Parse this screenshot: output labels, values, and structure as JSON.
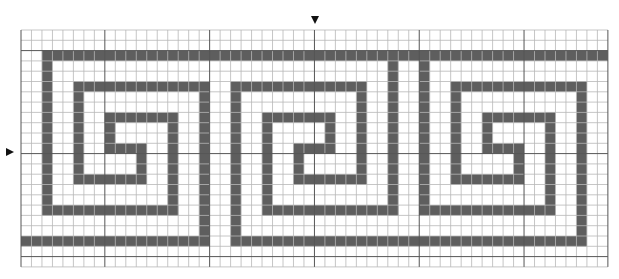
{
  "diagram": {
    "grid": {
      "origin_x": 21,
      "origin_y": 30,
      "cols": 56,
      "rows": 23,
      "cell_w": 10.48,
      "cell_h": 10.3,
      "major_every": 10,
      "major_col_offset": 8,
      "major_row_offset": 2,
      "line_color": "#b8b8b8",
      "major_line_color": "#555555",
      "fill_color": "#5e5e5e",
      "background": "#ffffff"
    },
    "markers": [
      {
        "name": "center-column-marker",
        "direction": "down",
        "col": 28
      },
      {
        "name": "center-row-marker",
        "direction": "right",
        "row": 12
      }
    ],
    "segments": [
      {
        "motif": "top-border",
        "type": "h",
        "row": 2,
        "from": 2,
        "to": 55
      },
      {
        "motif": "motif-1",
        "type": "v",
        "col": 2,
        "from": 2,
        "to": 17
      },
      {
        "motif": "motif-1",
        "type": "h",
        "row": 17,
        "from": 2,
        "to": 14
      },
      {
        "motif": "motif-1",
        "type": "v",
        "col": 14,
        "from": 8,
        "to": 17
      },
      {
        "motif": "motif-1",
        "type": "h",
        "row": 8,
        "from": 8,
        "to": 14
      },
      {
        "motif": "motif-1",
        "type": "v",
        "col": 8,
        "from": 8,
        "to": 11
      },
      {
        "motif": "motif-1",
        "type": "h",
        "row": 11,
        "from": 8,
        "to": 11
      },
      {
        "motif": "motif-1",
        "type": "v",
        "col": 11,
        "from": 11,
        "to": 14
      },
      {
        "motif": "motif-1",
        "type": "h",
        "row": 14,
        "from": 5,
        "to": 11
      },
      {
        "motif": "motif-1",
        "type": "v",
        "col": 5,
        "from": 5,
        "to": 14
      },
      {
        "motif": "motif-1",
        "type": "h",
        "row": 5,
        "from": 5,
        "to": 17
      },
      {
        "motif": "motif-1",
        "type": "v",
        "col": 17,
        "from": 5,
        "to": 20
      },
      {
        "motif": "bottom-border",
        "type": "h",
        "row": 20,
        "from": 0,
        "to": 17
      },
      {
        "motif": "motif-2",
        "type": "v",
        "col": 20,
        "from": 5,
        "to": 20
      },
      {
        "motif": "motif-2",
        "type": "h",
        "row": 5,
        "from": 20,
        "to": 32
      },
      {
        "motif": "motif-2",
        "type": "v",
        "col": 32,
        "from": 5,
        "to": 14
      },
      {
        "motif": "motif-2",
        "type": "h",
        "row": 14,
        "from": 26,
        "to": 32
      },
      {
        "motif": "motif-2",
        "type": "v",
        "col": 26,
        "from": 11,
        "to": 14
      },
      {
        "motif": "motif-2",
        "type": "h",
        "row": 11,
        "from": 26,
        "to": 29
      },
      {
        "motif": "motif-2",
        "type": "v",
        "col": 29,
        "from": 8,
        "to": 11
      },
      {
        "motif": "motif-2",
        "type": "h",
        "row": 8,
        "from": 23,
        "to": 29
      },
      {
        "motif": "motif-2",
        "type": "v",
        "col": 23,
        "from": 8,
        "to": 17
      },
      {
        "motif": "motif-2",
        "type": "h",
        "row": 17,
        "from": 23,
        "to": 35
      },
      {
        "motif": "motif-2",
        "type": "v",
        "col": 35,
        "from": 2,
        "to": 17
      },
      {
        "motif": "bottom-border",
        "type": "h",
        "row": 20,
        "from": 20,
        "to": 53
      },
      {
        "motif": "motif-3",
        "type": "v",
        "col": 38,
        "from": 2,
        "to": 17
      },
      {
        "motif": "motif-3",
        "type": "h",
        "row": 17,
        "from": 38,
        "to": 50
      },
      {
        "motif": "motif-3",
        "type": "v",
        "col": 50,
        "from": 8,
        "to": 17
      },
      {
        "motif": "motif-3",
        "type": "h",
        "row": 8,
        "from": 44,
        "to": 50
      },
      {
        "motif": "motif-3",
        "type": "v",
        "col": 44,
        "from": 8,
        "to": 11
      },
      {
        "motif": "motif-3",
        "type": "h",
        "row": 11,
        "from": 44,
        "to": 47
      },
      {
        "motif": "motif-3",
        "type": "v",
        "col": 47,
        "from": 11,
        "to": 14
      },
      {
        "motif": "motif-3",
        "type": "h",
        "row": 14,
        "from": 41,
        "to": 47
      },
      {
        "motif": "motif-3",
        "type": "v",
        "col": 41,
        "from": 5,
        "to": 14
      },
      {
        "motif": "motif-3",
        "type": "h",
        "row": 5,
        "from": 41,
        "to": 53
      },
      {
        "motif": "motif-3",
        "type": "v",
        "col": 53,
        "from": 5,
        "to": 20
      }
    ]
  }
}
